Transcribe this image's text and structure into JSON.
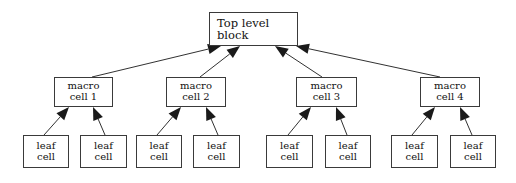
{
  "diagram": {
    "type": "tree",
    "levels": 3,
    "background_color": "#ffffff",
    "line_color": "#1a1a1a",
    "box_border_color": "#3a3a3a",
    "text_color": "#111111",
    "nodes": {
      "root": {
        "id": "top-level-block",
        "line1": "Top level",
        "line2": "block",
        "x": 209,
        "y": 12,
        "w": 89,
        "h": 34
      },
      "macro": [
        {
          "id": "macro-cell-1",
          "line1": "macro",
          "line2": "cell 1",
          "x": 54,
          "y": 77,
          "w": 59,
          "h": 30
        },
        {
          "id": "macro-cell-2",
          "line1": "macro",
          "line2": "cell 2",
          "x": 166,
          "y": 77,
          "w": 60,
          "h": 30
        },
        {
          "id": "macro-cell-3",
          "line1": "macro",
          "line2": "cell 3",
          "x": 296,
          "y": 77,
          "w": 61,
          "h": 30
        },
        {
          "id": "macro-cell-4",
          "line1": "macro",
          "line2": "cell 4",
          "x": 420,
          "y": 77,
          "w": 60,
          "h": 30
        }
      ],
      "leaf": [
        {
          "id": "leaf-cell-1",
          "line1": "leaf",
          "line2": "cell",
          "x": 23,
          "y": 135,
          "w": 46,
          "h": 33,
          "parent": "macro-cell-1"
        },
        {
          "id": "leaf-cell-2",
          "line1": "leaf",
          "line2": "cell",
          "x": 80,
          "y": 135,
          "w": 47,
          "h": 33,
          "parent": "macro-cell-1"
        },
        {
          "id": "leaf-cell-3",
          "line1": "leaf",
          "line2": "cell",
          "x": 136,
          "y": 135,
          "w": 46,
          "h": 33,
          "parent": "macro-cell-2"
        },
        {
          "id": "leaf-cell-4",
          "line1": "leaf",
          "line2": "cell",
          "x": 193,
          "y": 135,
          "w": 47,
          "h": 33,
          "parent": "macro-cell-2"
        },
        {
          "id": "leaf-cell-5",
          "line1": "leaf",
          "line2": "cell",
          "x": 266,
          "y": 135,
          "w": 47,
          "h": 33,
          "parent": "macro-cell-3"
        },
        {
          "id": "leaf-cell-6",
          "line1": "leaf",
          "line2": "cell",
          "x": 325,
          "y": 135,
          "w": 46,
          "h": 33,
          "parent": "macro-cell-3"
        },
        {
          "id": "leaf-cell-7",
          "line1": "leaf",
          "line2": "cell",
          "x": 391,
          "y": 135,
          "w": 47,
          "h": 33,
          "parent": "macro-cell-4"
        },
        {
          "id": "leaf-cell-8",
          "line1": "leaf",
          "line2": "cell",
          "x": 450,
          "y": 135,
          "w": 46,
          "h": 33,
          "parent": "macro-cell-4"
        }
      ]
    },
    "edges": [
      {
        "from": "macro-cell-1",
        "to": "top-level-block",
        "x1": 92,
        "y1": 77,
        "x2": 221,
        "y2": 46
      },
      {
        "from": "macro-cell-2",
        "to": "top-level-block",
        "x1": 200,
        "y1": 77,
        "x2": 240,
        "y2": 46
      },
      {
        "from": "macro-cell-3",
        "to": "top-level-block",
        "x1": 322,
        "y1": 77,
        "x2": 275,
        "y2": 46
      },
      {
        "from": "macro-cell-4",
        "to": "top-level-block",
        "x1": 440,
        "y1": 77,
        "x2": 296,
        "y2": 46
      },
      {
        "from": "leaf-cell-1",
        "to": "macro-cell-1",
        "x1": 44,
        "y1": 135,
        "x2": 69,
        "y2": 107
      },
      {
        "from": "leaf-cell-2",
        "to": "macro-cell-1",
        "x1": 105,
        "y1": 135,
        "x2": 93,
        "y2": 107
      },
      {
        "from": "leaf-cell-3",
        "to": "macro-cell-2",
        "x1": 157,
        "y1": 135,
        "x2": 181,
        "y2": 107
      },
      {
        "from": "leaf-cell-4",
        "to": "macro-cell-2",
        "x1": 218,
        "y1": 135,
        "x2": 206,
        "y2": 107
      },
      {
        "from": "leaf-cell-5",
        "to": "macro-cell-3",
        "x1": 288,
        "y1": 135,
        "x2": 311,
        "y2": 107
      },
      {
        "from": "leaf-cell-6",
        "to": "macro-cell-3",
        "x1": 347,
        "y1": 135,
        "x2": 336,
        "y2": 107
      },
      {
        "from": "leaf-cell-7",
        "to": "macro-cell-4",
        "x1": 412,
        "y1": 135,
        "x2": 435,
        "y2": 107
      },
      {
        "from": "leaf-cell-8",
        "to": "macro-cell-4",
        "x1": 472,
        "y1": 135,
        "x2": 460,
        "y2": 107
      }
    ]
  }
}
